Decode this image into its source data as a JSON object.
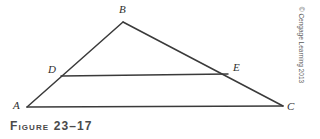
{
  "figure": {
    "caption": "Figure 23–17",
    "copyright": "© Cengage Learning 2013",
    "background_color": "#ffffff",
    "line_color": "#3a3a3a",
    "label_color": "#2e2e2e",
    "caption_color": "#4a4a4a"
  },
  "diagram": {
    "type": "geometric-figure",
    "points": {
      "A": {
        "label": "A",
        "x": 27,
        "y": 107
      },
      "B": {
        "label": "B",
        "x": 123,
        "y": 22
      },
      "C": {
        "label": "C",
        "x": 283,
        "y": 106
      },
      "D": {
        "label": "D",
        "x": 61,
        "y": 76
      },
      "E": {
        "label": "E",
        "x": 228,
        "y": 74
      }
    },
    "segments": [
      {
        "name": "AB",
        "from": "A",
        "to": "B"
      },
      {
        "name": "BC",
        "from": "B",
        "to": "C"
      },
      {
        "name": "AC",
        "from": "A",
        "to": "C"
      },
      {
        "name": "DE",
        "from": "D",
        "to": "E"
      }
    ]
  }
}
